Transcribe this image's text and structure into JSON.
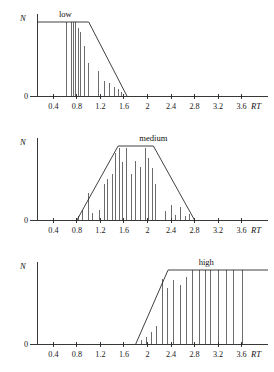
{
  "figure": {
    "background_color": "#ffffff",
    "line_color": "#1f1f1f",
    "spike_color": "#3a3a3a",
    "axis_color": "#222222"
  },
  "chart_data": [
    {
      "type": "area",
      "title": "low",
      "xlabel": "RT",
      "ylabel": "N",
      "xlim": [
        0.0,
        4.0
      ],
      "ylim": [
        0,
        1
      ],
      "grid": false,
      "legend": "none",
      "y_tick_labels": [
        "0"
      ],
      "y_tick_values": [
        0
      ],
      "x_tick_labels": [
        "0.4",
        "0.8",
        "1.2",
        "1.6",
        "2",
        "2.4",
        "2.8",
        "3.2",
        "3.6"
      ],
      "x_tick_values": [
        0.4,
        0.8,
        1.2,
        1.6,
        2.0,
        2.4,
        2.8,
        3.2,
        3.6
      ],
      "membership_function": {
        "name": "low",
        "shape": "trapezoid-right-shoulder",
        "points": [
          [
            0.5,
            1.0
          ],
          [
            1.0,
            1.0
          ],
          [
            1.65,
            0.0
          ]
        ]
      },
      "series": [
        {
          "name": "histogram spikes",
          "x": [
            0.4,
            0.63,
            0.7,
            0.74,
            0.78,
            0.82,
            0.86,
            0.93,
            1.0,
            1.16,
            1.26,
            1.36,
            1.44,
            1.5,
            1.56,
            1.6
          ],
          "values": [
            0.0,
            1.0,
            1.0,
            1.0,
            1.0,
            0.92,
            0.86,
            0.67,
            0.45,
            0.34,
            0.2,
            0.17,
            0.12,
            0.1,
            0.06,
            0.03
          ]
        }
      ]
    },
    {
      "type": "area",
      "title": "medium",
      "xlabel": "RT",
      "ylabel": "N",
      "xlim": [
        0.0,
        4.0
      ],
      "ylim": [
        0,
        1
      ],
      "grid": false,
      "legend": "none",
      "y_tick_labels": [
        "0"
      ],
      "y_tick_values": [
        0
      ],
      "x_tick_labels": [
        "0.4",
        "0.8",
        "1.2",
        "1.6",
        "2",
        "2.4",
        "2.8",
        "3.2",
        "3.6"
      ],
      "x_tick_values": [
        0.4,
        0.8,
        1.2,
        1.6,
        2.0,
        2.4,
        2.8,
        3.2,
        3.6
      ],
      "membership_function": {
        "name": "medium",
        "shape": "trapezoid",
        "points": [
          [
            0.8,
            0.0
          ],
          [
            1.5,
            1.0
          ],
          [
            2.1,
            1.0
          ],
          [
            2.8,
            0.0
          ]
        ]
      },
      "series": [
        {
          "name": "histogram spikes",
          "x": [
            0.4,
            0.82,
            0.9,
            1.0,
            1.06,
            1.18,
            1.26,
            1.32,
            1.4,
            1.46,
            1.52,
            1.58,
            1.64,
            1.72,
            1.8,
            1.88,
            1.96,
            2.02,
            2.08,
            2.14,
            2.3,
            2.4,
            2.48,
            2.56,
            2.64,
            2.72
          ],
          "values": [
            0.0,
            0.06,
            0.14,
            0.36,
            0.1,
            0.14,
            0.48,
            0.56,
            0.62,
            0.9,
            0.97,
            0.78,
            0.97,
            0.62,
            0.8,
            0.71,
            0.97,
            0.84,
            0.7,
            0.48,
            0.12,
            0.2,
            0.07,
            0.18,
            0.06,
            0.08
          ]
        }
      ]
    },
    {
      "type": "area",
      "title": "high",
      "xlabel": "RT",
      "ylabel": "N",
      "xlim": [
        0.0,
        4.0
      ],
      "ylim": [
        0,
        1
      ],
      "grid": false,
      "legend": "none",
      "y_tick_labels": [
        "0"
      ],
      "y_tick_values": [
        0
      ],
      "x_tick_labels": [
        "0.4",
        "0.8",
        "1.2",
        "1.6",
        "2",
        "2.4",
        "2.8",
        "3.2",
        "3.6"
      ],
      "x_tick_values": [
        0.4,
        0.8,
        1.2,
        1.6,
        2.0,
        2.4,
        2.8,
        3.2,
        3.6
      ],
      "membership_function": {
        "name": "high",
        "shape": "trapezoid-left-shoulder",
        "points": [
          [
            1.8,
            0.0
          ],
          [
            2.35,
            1.0
          ],
          [
            3.95,
            1.0
          ]
        ]
      },
      "series": [
        {
          "name": "histogram spikes",
          "x": [
            1.9,
            1.98,
            2.06,
            2.16,
            2.26,
            2.34,
            2.44,
            2.56,
            2.66,
            2.76,
            2.88,
            2.98,
            3.08,
            3.2,
            3.34,
            3.46,
            3.62
          ],
          "values": [
            0.06,
            0.1,
            0.16,
            0.25,
            0.88,
            0.76,
            0.87,
            0.8,
            0.9,
            1.0,
            1.0,
            1.0,
            1.0,
            1.0,
            1.0,
            1.0,
            1.0
          ]
        }
      ]
    }
  ]
}
